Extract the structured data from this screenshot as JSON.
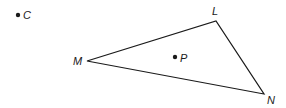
{
  "diagram": {
    "points": {
      "C": {
        "label": "C",
        "x": 18,
        "y": 15
      },
      "P": {
        "label": "P",
        "x": 175,
        "y": 57
      }
    },
    "triangle": {
      "vertices": {
        "M": {
          "label": "M",
          "x": 87,
          "y": 61
        },
        "L": {
          "label": "L",
          "x": 216,
          "y": 21
        },
        "N": {
          "label": "N",
          "x": 264,
          "y": 94
        }
      }
    },
    "stroke_color": "#1a1a1a"
  }
}
